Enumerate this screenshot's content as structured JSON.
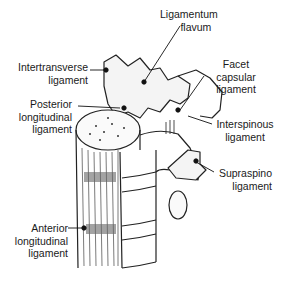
{
  "diagram": {
    "labels": [
      {
        "id": "ligamentum-flavum",
        "lines": [
          "Ligamentum",
          "flavum"
        ]
      },
      {
        "id": "intertransverse-ligament",
        "lines": [
          "Intertransverse",
          "ligament"
        ]
      },
      {
        "id": "facet-capsular-ligament",
        "lines": [
          "Facet",
          "capsular",
          "ligament"
        ]
      },
      {
        "id": "posterior-longitudinal-ligament",
        "lines": [
          "Posterior",
          "longitudinal",
          "ligament"
        ]
      },
      {
        "id": "interspinous-ligament",
        "lines": [
          "Interspinous",
          "ligament"
        ]
      },
      {
        "id": "supraspino-ligament",
        "lines": [
          "Supraspino",
          "ligament"
        ]
      },
      {
        "id": "anterior-longitudinal-ligament",
        "lines": [
          "Anterior",
          "longitudinal",
          "ligament"
        ]
      }
    ]
  }
}
